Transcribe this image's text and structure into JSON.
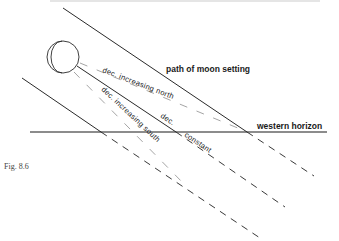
{
  "figure": {
    "caption": "Fig. 8.6",
    "labels": {
      "path": "path of moon  setting",
      "horizon": "western horizon",
      "north": "dec. increasing  north",
      "constant_a": "dec.",
      "constant_b": "constant",
      "south": "dec. increasing  south"
    },
    "colors": {
      "line": "#2a2a2a",
      "dashed": "#3a3a3a",
      "faint": "#9a9a9a"
    }
  }
}
